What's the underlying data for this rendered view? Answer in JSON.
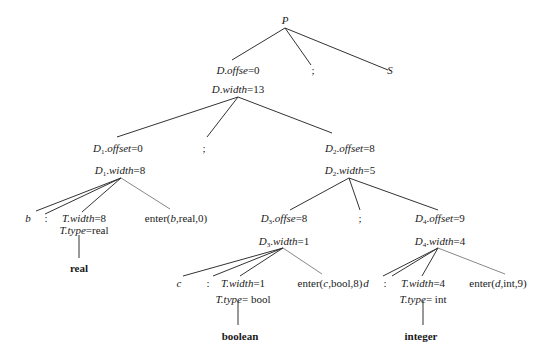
{
  "diagram": {
    "type": "annotated-parse-tree",
    "nodes": {
      "P": {
        "label": "P"
      },
      "D_root": {
        "line1": {
          "var": "D",
          "sub": "",
          "attr": "offse",
          "value": "=0"
        },
        "line2": {
          "var": "D",
          "sub": "",
          "attr": "width",
          "value": "=13"
        }
      },
      "semi1": {
        "label": ";"
      },
      "S": {
        "label": "S"
      },
      "D1": {
        "line1": {
          "var": "D",
          "sub": "1",
          "attr": "offset",
          "value": "=0"
        },
        "line2": {
          "var": "D",
          "sub": "1",
          "attr": "width",
          "value": "=8"
        }
      },
      "semi2": {
        "label": ";"
      },
      "D2": {
        "line1": {
          "var": "D",
          "sub": "2",
          "attr": "offset",
          "value": "=8"
        },
        "line2": {
          "var": "D",
          "sub": "2",
          "attr": "width",
          "value": "=5"
        }
      },
      "b": {
        "label": "b"
      },
      "colon1": {
        "label": ":"
      },
      "T1": {
        "line1": {
          "attr": "T.width",
          "value": "=8"
        },
        "line2": {
          "attr": "T.type",
          "value": "=real"
        }
      },
      "enter1": {
        "prefix": "enter(",
        "id": "b",
        "rest": ",real,0)"
      },
      "real": {
        "label": "real"
      },
      "D3": {
        "line1": {
          "var": "D",
          "sub": "3",
          "attr": "offse",
          "value": "=8"
        },
        "line2": {
          "var": "D",
          "sub": "3",
          "attr": "width",
          "value": "=1"
        }
      },
      "semi3": {
        "label": ";"
      },
      "D4": {
        "line1": {
          "var": "D",
          "sub": "4",
          "attr": "offset",
          "value": "=9"
        },
        "line2": {
          "var": "D",
          "sub": "4",
          "attr": "width",
          "value": "=4"
        }
      },
      "c": {
        "label": "c"
      },
      "colon2": {
        "label": ":"
      },
      "T2": {
        "line1": {
          "attr": "T.width",
          "value": "=1"
        },
        "line2": {
          "attr": "T.type",
          "value": "= bool"
        }
      },
      "enter2": {
        "prefix": "enter(",
        "id": "c",
        "rest": ",bool,8)"
      },
      "boolean": {
        "label": "boolean"
      },
      "d": {
        "label": "d"
      },
      "colon3": {
        "label": ":"
      },
      "T3": {
        "line1": {
          "attr": "T.width",
          "value": "=4"
        },
        "line2": {
          "attr": "T.type",
          "value": "= int"
        }
      },
      "enter3": {
        "prefix": "enter(",
        "id": "d",
        "rest": ",int,9)"
      },
      "integer": {
        "label": "integer"
      }
    },
    "edges": [
      [
        "P",
        "D_root"
      ],
      [
        "P",
        "semi1"
      ],
      [
        "P",
        "S"
      ],
      [
        "D_root",
        "D1"
      ],
      [
        "D_root",
        "semi2"
      ],
      [
        "D_root",
        "D2"
      ],
      [
        "D1",
        "b"
      ],
      [
        "D1",
        "colon1"
      ],
      [
        "D1",
        "T1"
      ],
      [
        "D1",
        "enter1"
      ],
      [
        "T1",
        "real"
      ],
      [
        "D2",
        "D3"
      ],
      [
        "D2",
        "semi3"
      ],
      [
        "D2",
        "D4"
      ],
      [
        "D3",
        "c"
      ],
      [
        "D3",
        "colon2"
      ],
      [
        "D3",
        "T2"
      ],
      [
        "D3",
        "enter2"
      ],
      [
        "T2",
        "boolean"
      ],
      [
        "D4",
        "d"
      ],
      [
        "D4",
        "colon3"
      ],
      [
        "D4",
        "T3"
      ],
      [
        "D4",
        "enter3"
      ],
      [
        "T3",
        "integer"
      ]
    ]
  }
}
